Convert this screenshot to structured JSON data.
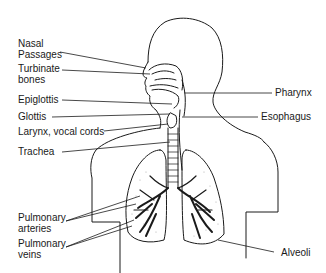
{
  "diagram": {
    "labels_left": [
      {
        "id": "nasal",
        "line1": "Nasal",
        "line2": "Passages"
      },
      {
        "id": "turbinate",
        "line1": "Turbinate",
        "line2": "bones"
      },
      {
        "id": "epiglottis",
        "line1": "Epiglottis"
      },
      {
        "id": "glottis",
        "line1": "Glottis"
      },
      {
        "id": "larynx",
        "line1": "Larynx, vocal cords"
      },
      {
        "id": "trachea",
        "line1": "Trachea"
      },
      {
        "id": "pul_arteries",
        "line1": "Pulmonary",
        "line2": "arteries"
      },
      {
        "id": "pul_veins",
        "line1": "Pulmonary",
        "line2": "veins"
      }
    ],
    "labels_right": [
      {
        "id": "pharynx",
        "line1": "Pharynx"
      },
      {
        "id": "esophagus",
        "line1": "Esophagus"
      },
      {
        "id": "alveoli",
        "line1": "Alveoli"
      }
    ],
    "colors": {
      "line": "#1a1a1a",
      "background": "#ffffff"
    }
  }
}
